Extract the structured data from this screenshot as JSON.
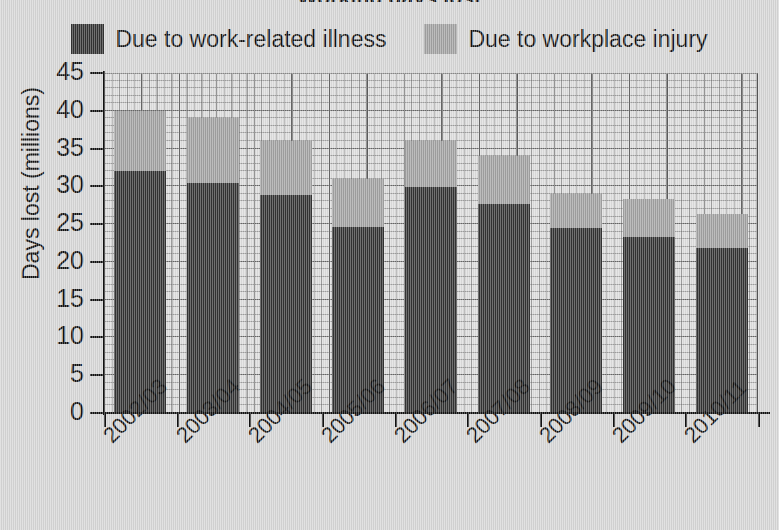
{
  "title_sliver": "Working days lost",
  "legend": {
    "position": "top-center",
    "entries": [
      {
        "label": "Due to work-related illness",
        "color": "#333333",
        "swatch": "dark-swatch"
      },
      {
        "label": "Due to workplace injury",
        "color": "#a0a0a0",
        "swatch": "light-swatch"
      }
    ]
  },
  "axes": {
    "ylabel": "Days lost (millions)",
    "xlabel": "",
    "yticks": [
      0,
      5,
      10,
      15,
      20,
      25,
      30,
      35,
      40,
      45
    ],
    "ylim": [
      0,
      45
    ]
  },
  "chart_data": {
    "type": "bar",
    "stacked": true,
    "title": "Working days lost",
    "xlabel": "",
    "ylabel": "Days lost (millions)",
    "ylim": [
      0,
      45
    ],
    "yticks": [
      0,
      5,
      10,
      15,
      20,
      25,
      30,
      35,
      40,
      45
    ],
    "grid": true,
    "legend_position": "top-center",
    "categories": [
      "2002/03",
      "2003/04",
      "2004/05",
      "2005/06",
      "2006/07",
      "2007/08",
      "2008/09",
      "2009/10",
      "2010/11"
    ],
    "series": [
      {
        "name": "Due to work-related illness",
        "color": "#333333",
        "values": [
          32.0,
          30.4,
          28.8,
          24.6,
          29.9,
          27.7,
          24.5,
          23.3,
          21.8
        ]
      },
      {
        "name": "Due to workplace injury",
        "color": "#a0a0a0",
        "values": [
          8.0,
          8.6,
          7.2,
          6.4,
          6.1,
          6.3,
          4.5,
          5.0,
          4.5
        ]
      }
    ],
    "totals": [
      40.0,
      39.0,
      36.0,
      31.0,
      36.0,
      34.0,
      29.0,
      28.3,
      26.3
    ]
  },
  "colors": {
    "background": "#d5d5d5",
    "plot_background": "#dcdcdc",
    "gridline": "#6e6e6e",
    "axis": "#111111",
    "illness": "#333333",
    "injury": "#a0a0a0"
  }
}
